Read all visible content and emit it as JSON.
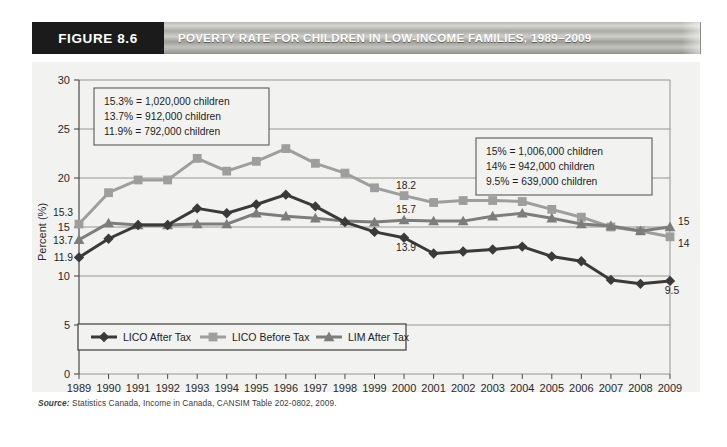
{
  "header": {
    "figure_number": "FIGURE 8.6",
    "title": "POVERTY RATE FOR CHILDREN IN LOW-INCOME FAMILIES, 1989–2009"
  },
  "source": {
    "prefix": "Source:",
    "text": " Statistics Canada, Income in Canada, CANSIM Table 202-0802, 2009."
  },
  "annotations": {
    "left_box": [
      "15.3% = 1,020,000 children",
      "13.7% = 912,000 children",
      "11.9% = 792,000 children"
    ],
    "right_box": [
      "15% = 1,006,000 children",
      "14% = 942,000 children",
      "9.5% = 639,000 children"
    ]
  },
  "point_labels": [
    {
      "text": "15.3",
      "year": 1989,
      "value": 15.3,
      "dx": -6,
      "dy": -8,
      "anchor": "end"
    },
    {
      "text": "13.7",
      "year": 1989,
      "value": 13.7,
      "dx": -6,
      "dy": 4,
      "anchor": "end"
    },
    {
      "text": "11.9",
      "year": 1989,
      "value": 11.9,
      "dx": -6,
      "dy": 4,
      "anchor": "end"
    },
    {
      "text": "18.2",
      "year": 2000,
      "value": 18.2,
      "dx": 2,
      "dy": -7,
      "anchor": "middle"
    },
    {
      "text": "15.7",
      "year": 2000,
      "value": 15.7,
      "dx": 2,
      "dy": -7,
      "anchor": "middle"
    },
    {
      "text": "13.9",
      "year": 2000,
      "value": 13.9,
      "dx": 2,
      "dy": 13,
      "anchor": "middle"
    },
    {
      "text": "15",
      "year": 2009,
      "value": 15.0,
      "dx": 8,
      "dy": -2,
      "anchor": "start"
    },
    {
      "text": "14",
      "year": 2009,
      "value": 14.0,
      "dx": 8,
      "dy": 10,
      "anchor": "start"
    },
    {
      "text": "9.5",
      "year": 2009,
      "value": 9.5,
      "dx": 2,
      "dy": 13,
      "anchor": "middle"
    }
  ],
  "chart_data": {
    "type": "line",
    "title": "POVERTY RATE FOR CHILDREN IN LOW-INCOME FAMILIES, 1989–2009",
    "xlabel": "",
    "ylabel": "Percent (%)",
    "ylim": [
      0,
      30
    ],
    "ytick_labels": [
      "0",
      "5",
      "10",
      "15",
      "20",
      "25",
      "30"
    ],
    "yticks": [
      0,
      5,
      10,
      15,
      20,
      25,
      30
    ],
    "grid": true,
    "legend_position": "bottom-left",
    "x": [
      1989,
      1990,
      1991,
      1992,
      1993,
      1994,
      1995,
      1996,
      1997,
      1998,
      1999,
      2000,
      2001,
      2002,
      2003,
      2004,
      2005,
      2006,
      2007,
      2008,
      2009
    ],
    "xtick_labels": [
      "1989",
      "1990",
      "1991",
      "1992",
      "1993",
      "1994",
      "1995",
      "1996",
      "1997",
      "1998",
      "1999",
      "2000",
      "2001",
      "2002",
      "2003",
      "2004",
      "2005",
      "2006",
      "2007",
      "2008",
      "2009"
    ],
    "series": [
      {
        "name": "LICO After Tax",
        "color": "#3a3a3a",
        "marker": "diamond",
        "values": [
          11.9,
          13.8,
          15.2,
          15.2,
          16.9,
          16.4,
          17.3,
          18.3,
          17.1,
          15.5,
          14.5,
          13.9,
          12.3,
          12.5,
          12.7,
          13.0,
          12.0,
          11.5,
          9.6,
          9.2,
          9.5
        ]
      },
      {
        "name": "LICO Before Tax",
        "color": "#9e9e9e",
        "marker": "square",
        "values": [
          15.3,
          18.5,
          19.8,
          19.8,
          22.0,
          20.7,
          21.7,
          23.0,
          21.5,
          20.5,
          19.0,
          18.2,
          17.5,
          17.7,
          17.7,
          17.6,
          16.8,
          16.0,
          15.0,
          14.6,
          14.0
        ]
      },
      {
        "name": "LIM After Tax",
        "color": "#7d7d7d",
        "marker": "triangle",
        "values": [
          13.7,
          15.4,
          15.2,
          15.2,
          15.3,
          15.3,
          16.4,
          16.1,
          15.9,
          15.6,
          15.5,
          15.7,
          15.6,
          15.6,
          16.1,
          16.4,
          15.9,
          15.3,
          15.1,
          14.6,
          15.0
        ]
      }
    ]
  }
}
